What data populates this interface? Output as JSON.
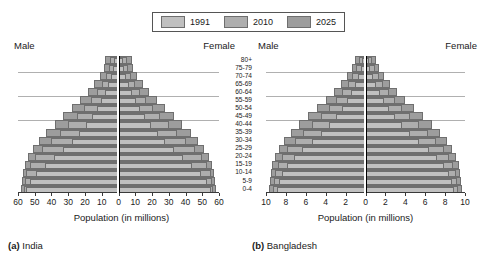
{
  "legend": {
    "items": [
      {
        "label": "1991",
        "color": "#c0c0c0"
      },
      {
        "label": "2010",
        "color": "#aeaeae"
      },
      {
        "label": "2025",
        "color": "#9d9d9d"
      }
    ]
  },
  "labels": {
    "male": "Male",
    "female": "Female",
    "x_axis_title": "Population (in millions)"
  },
  "panels": [
    {
      "caption_marker": "(a)",
      "caption_name": "India",
      "x_ticks_left": [
        "60",
        "50",
        "40",
        "30",
        "20",
        "10",
        "0"
      ],
      "x_ticks_right": [
        "0",
        "10",
        "20",
        "30",
        "40",
        "50",
        "60"
      ]
    },
    {
      "caption_marker": "(b)",
      "caption_name": "Bangladesh",
      "x_ticks_left": [
        "10",
        "8",
        "6",
        "4",
        "2",
        "0"
      ],
      "x_ticks_right": [
        "0",
        "2",
        "4",
        "6",
        "8",
        "10"
      ]
    }
  ],
  "chart_data": {
    "type": "bar",
    "subtype": "population-pyramid",
    "title": "",
    "xlabel": "Population (in millions)",
    "ylabel": "",
    "grid": true,
    "legend_position": "top-center",
    "age_groups": [
      "80+",
      "75-79",
      "70-74",
      "65-69",
      "60-64",
      "55-59",
      "50-54",
      "45-49",
      "40-44",
      "35-39",
      "30-34",
      "25-29",
      "20-24",
      "15-19",
      "10-14",
      "5-9",
      "0-4"
    ],
    "charts": [
      {
        "name": "India",
        "caption": "(a) India",
        "xlim": [
          -60,
          60
        ],
        "xticks": [
          -60,
          -50,
          -40,
          -30,
          -20,
          -10,
          0,
          10,
          20,
          30,
          40,
          50,
          60
        ],
        "series": [
          {
            "name": "1991",
            "male": [
              2.5,
              3.0,
              4.5,
              6.0,
              8.0,
              10.5,
              13.0,
              16.0,
              19.5,
              23.5,
              28.0,
              33.0,
              38.5,
              44.0,
              49.0,
              53.0,
              55.0
            ],
            "female": [
              2.5,
              3.0,
              4.5,
              6.0,
              8.0,
              10.5,
              13.0,
              16.0,
              19.5,
              23.5,
              28.0,
              33.0,
              38.5,
              44.0,
              49.0,
              53.0,
              55.0
            ]
          },
          {
            "name": "2010",
            "male": [
              5.0,
              5.5,
              7.5,
              10.0,
              13.0,
              16.5,
              20.5,
              25.0,
              30.0,
              35.0,
              40.5,
              45.5,
              50.0,
              53.0,
              55.0,
              56.0,
              56.5
            ],
            "female": [
              5.0,
              5.5,
              7.5,
              10.0,
              13.0,
              16.5,
              20.5,
              25.0,
              30.0,
              35.0,
              40.5,
              45.5,
              50.0,
              53.0,
              55.0,
              56.0,
              56.5
            ]
          },
          {
            "name": "2025",
            "male": [
              8.0,
              8.5,
              11.0,
              14.5,
              18.5,
              23.0,
              28.0,
              33.0,
              38.0,
              43.0,
              47.5,
              51.0,
              54.0,
              56.0,
              57.0,
              57.5,
              58.0
            ],
            "female": [
              8.0,
              8.5,
              11.0,
              14.5,
              18.5,
              23.0,
              28.0,
              33.0,
              38.0,
              43.0,
              47.5,
              51.0,
              54.0,
              56.0,
              57.0,
              57.5,
              58.0
            ]
          }
        ]
      },
      {
        "name": "Bangladesh",
        "caption": "(b) Bangladesh",
        "xlim": [
          -10,
          10
        ],
        "xticks": [
          -10,
          -8,
          -6,
          -4,
          -2,
          0,
          2,
          4,
          6,
          8,
          10
        ],
        "series": [
          {
            "name": "1991",
            "male": [
              0.35,
              0.5,
              0.8,
              1.1,
              1.5,
              1.9,
              2.4,
              3.0,
              3.7,
              4.5,
              5.4,
              6.4,
              7.2,
              7.9,
              8.4,
              8.7,
              8.9
            ],
            "female": [
              0.35,
              0.5,
              0.8,
              1.1,
              1.5,
              1.9,
              2.4,
              3.0,
              3.7,
              4.5,
              5.4,
              6.4,
              7.2,
              7.9,
              8.4,
              8.7,
              8.9
            ]
          },
          {
            "name": "2010",
            "male": [
              0.7,
              0.95,
              1.35,
              1.8,
              2.35,
              3.0,
              3.7,
              4.5,
              5.4,
              6.3,
              7.1,
              7.9,
              8.4,
              8.8,
              9.1,
              9.2,
              9.3
            ],
            "female": [
              0.7,
              0.95,
              1.35,
              1.8,
              2.35,
              3.0,
              3.7,
              4.5,
              5.4,
              6.3,
              7.1,
              7.9,
              8.4,
              8.8,
              9.1,
              9.2,
              9.3
            ]
          },
          {
            "name": "2025",
            "male": [
              1.1,
              1.4,
              1.9,
              2.5,
              3.2,
              4.0,
              4.9,
              5.8,
              6.7,
              7.5,
              8.2,
              8.7,
              9.1,
              9.4,
              9.5,
              9.6,
              9.7
            ],
            "female": [
              1.1,
              1.4,
              1.9,
              2.5,
              3.2,
              4.0,
              4.9,
              5.8,
              6.7,
              7.5,
              8.2,
              8.7,
              9.1,
              9.4,
              9.5,
              9.6,
              9.7
            ]
          }
        ]
      }
    ]
  }
}
